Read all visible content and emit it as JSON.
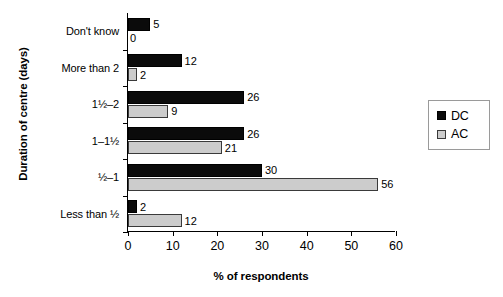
{
  "chart_data": {
    "type": "bar",
    "orientation": "horizontal",
    "title": "",
    "xlabel": "% of respondents",
    "ylabel": "Duration of centre (days)",
    "xlim": [
      0,
      60
    ],
    "xticks": [
      "0",
      "10",
      "20",
      "30",
      "40",
      "50",
      "60"
    ],
    "grid": false,
    "legend_position": "right",
    "categories": [
      "Don't know",
      "More than 2",
      "1½–2",
      "1–1½",
      "½–1",
      "Less than ½"
    ],
    "series": [
      {
        "name": "DC",
        "color": "#0b0b0b",
        "values": [
          5,
          12,
          26,
          26,
          30,
          2
        ]
      },
      {
        "name": "AC",
        "color": "#cccccc",
        "values": [
          0,
          2,
          9,
          21,
          56,
          12
        ]
      }
    ],
    "value_labels": {
      "DC": [
        "5",
        "12",
        "26",
        "26",
        "30",
        "2"
      ],
      "AC": [
        "0",
        "2",
        "9",
        "21",
        "56",
        "12"
      ]
    }
  },
  "legend": {
    "items": [
      {
        "label": "DC",
        "swatch": "black-square-icon"
      },
      {
        "label": "AC",
        "swatch": "gray-square-icon"
      }
    ]
  }
}
